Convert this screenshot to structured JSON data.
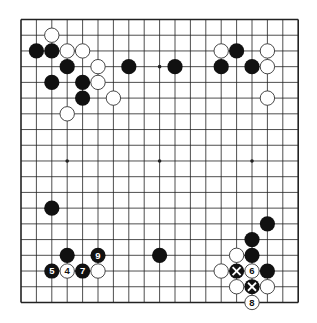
{
  "diagram": {
    "type": "go-board",
    "size": 19,
    "colors": {
      "background": "#ffffff",
      "grid": "#222222",
      "black_stone": "#111111",
      "white_stone": "#ffffff",
      "white_stroke": "#333333"
    },
    "star_points": [
      [
        3,
        3
      ],
      [
        9,
        3
      ],
      [
        15,
        3
      ],
      [
        3,
        9
      ],
      [
        9,
        9
      ],
      [
        15,
        9
      ],
      [
        3,
        15
      ],
      [
        9,
        15
      ],
      [
        15,
        15
      ]
    ],
    "stones": [
      {
        "col": 2,
        "row": 1,
        "color": "white"
      },
      {
        "col": 1,
        "row": 2,
        "color": "black"
      },
      {
        "col": 2,
        "row": 2,
        "color": "black"
      },
      {
        "col": 3,
        "row": 2,
        "color": "white"
      },
      {
        "col": 4,
        "row": 2,
        "color": "white"
      },
      {
        "col": 3,
        "row": 3,
        "color": "black"
      },
      {
        "col": 5,
        "row": 3,
        "color": "white"
      },
      {
        "col": 7,
        "row": 3,
        "color": "black"
      },
      {
        "col": 10,
        "row": 3,
        "color": "black"
      },
      {
        "col": 2,
        "row": 4,
        "color": "black"
      },
      {
        "col": 4,
        "row": 4,
        "color": "black"
      },
      {
        "col": 5,
        "row": 4,
        "color": "white"
      },
      {
        "col": 4,
        "row": 5,
        "color": "black"
      },
      {
        "col": 6,
        "row": 5,
        "color": "white"
      },
      {
        "col": 3,
        "row": 6,
        "color": "white"
      },
      {
        "col": 13,
        "row": 2,
        "color": "white"
      },
      {
        "col": 14,
        "row": 2,
        "color": "black"
      },
      {
        "col": 16,
        "row": 2,
        "color": "white"
      },
      {
        "col": 13,
        "row": 3,
        "color": "black"
      },
      {
        "col": 15,
        "row": 3,
        "color": "black"
      },
      {
        "col": 16,
        "row": 3,
        "color": "white"
      },
      {
        "col": 16,
        "row": 5,
        "color": "white"
      },
      {
        "col": 2,
        "row": 12,
        "color": "black"
      },
      {
        "col": 3,
        "row": 15,
        "color": "black"
      },
      {
        "col": 5,
        "row": 15,
        "color": "black",
        "label": "9"
      },
      {
        "col": 2,
        "row": 16,
        "color": "black",
        "label": "5"
      },
      {
        "col": 3,
        "row": 16,
        "color": "white",
        "label": "4"
      },
      {
        "col": 4,
        "row": 16,
        "color": "black",
        "label": "7"
      },
      {
        "col": 5,
        "row": 16,
        "color": "white"
      },
      {
        "col": 9,
        "row": 15,
        "color": "black"
      },
      {
        "col": 16,
        "row": 13,
        "color": "black"
      },
      {
        "col": 15,
        "row": 14,
        "color": "black"
      },
      {
        "col": 14,
        "row": 15,
        "color": "white"
      },
      {
        "col": 15,
        "row": 15,
        "color": "black"
      },
      {
        "col": 13,
        "row": 16,
        "color": "white"
      },
      {
        "col": 14,
        "row": 16,
        "color": "black",
        "mark": "x"
      },
      {
        "col": 15,
        "row": 16,
        "color": "white",
        "label": "6"
      },
      {
        "col": 16,
        "row": 16,
        "color": "black"
      },
      {
        "col": 14,
        "row": 17,
        "color": "white"
      },
      {
        "col": 15,
        "row": 17,
        "color": "black",
        "mark": "x"
      },
      {
        "col": 16,
        "row": 17,
        "color": "white"
      },
      {
        "col": 15,
        "row": 18,
        "color": "white",
        "label": "8"
      }
    ]
  }
}
